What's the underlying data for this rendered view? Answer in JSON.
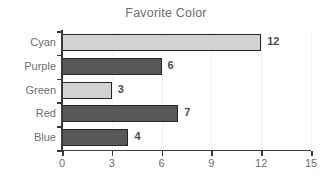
{
  "chart_data": {
    "type": "bar",
    "orientation": "horizontal",
    "title": "Favorite Color",
    "xlabel": "",
    "ylabel": "",
    "categories": [
      "Cyan",
      "Purple",
      "Green",
      "Red",
      "Blue"
    ],
    "values": [
      12,
      6,
      3,
      7,
      4
    ],
    "value_labels": [
      "12",
      "6",
      "3",
      "7",
      "4"
    ],
    "bar_colors": [
      "#d2d2d2",
      "#585858",
      "#d2d2d2",
      "#585858",
      "#585858"
    ],
    "bar_border_color": "#262626",
    "xlim": [
      0,
      15
    ],
    "xticks": [
      0,
      3,
      6,
      9,
      12,
      15
    ],
    "xtick_labels": [
      "0",
      "3",
      "6",
      "9",
      "12",
      "15"
    ],
    "grid": false,
    "legend": null,
    "axis_color": "#3a3a3a",
    "label_color": "#6e6e6e",
    "title_color": "#6e6e6e",
    "background": "#ffffff"
  }
}
